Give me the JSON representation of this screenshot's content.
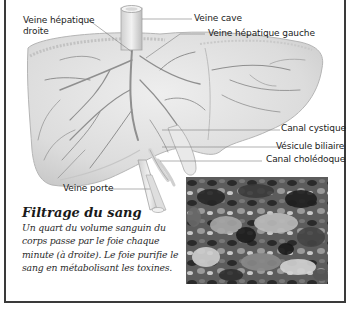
{
  "labels": {
    "veine_hepatique_droite_line1": "Veine hépatique",
    "veine_hepatique_droite_line2": "droite",
    "veine_cave": "Veine cave",
    "veine_hepatique_gauche": "Veine hépatique gauche",
    "canal_cystique": "Canal cystique",
    "vesicule_biliaire": "Vésicule biliaire",
    "canal_choledoque": "Canal cholédoque",
    "veine_porte": "Veine porte"
  },
  "caption": {
    "title": "Filtrage du sang",
    "body": "Un quart du volume sanguin du corps passe par le foie chaque minute (à droite). Le foie purifie le sang en métabolisant les toxines."
  },
  "colors": {
    "liver_fill": "#e4e4e4",
    "liver_outline": "#b8b8b8",
    "vessel": "#8a8a8a",
    "leader_line": "#7a7a7a",
    "frame_border": "#3a3a3a",
    "text": "#1c1c1c"
  }
}
